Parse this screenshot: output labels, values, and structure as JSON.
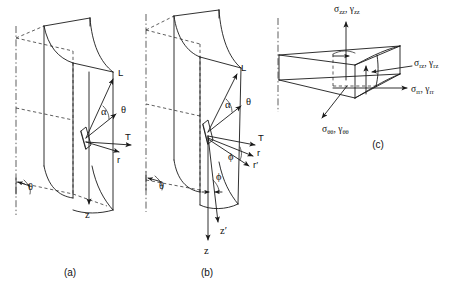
{
  "figure": {
    "background_color": "#ffffff",
    "line_color": "#1a1a1a",
    "width": 467,
    "height": 291
  },
  "panels": [
    {
      "id": "a",
      "caption": "(a)",
      "description": "cylindrical-sector-with-surface-element-single-axis",
      "labels": {
        "vector_L": "L",
        "angle_alpha": "α",
        "vector_theta": "θ",
        "vector_T": "T",
        "vector_r": "r",
        "angle_theta": "θ",
        "axis_z": "z"
      }
    },
    {
      "id": "b",
      "caption": "(b)",
      "description": "cylindrical-sector-with-surface-element-twisted-axes",
      "labels": {
        "vector_L": "L",
        "angle_alpha": "α",
        "vector_theta": "θ",
        "vector_T": "T",
        "vector_r": "r",
        "vector_r_prime": "r′",
        "angle_phi_vectors": "ϕ",
        "angle_theta": "θ",
        "angle_phi_base": "ϕ",
        "axis_z": "z",
        "axis_z_prime": "z′"
      }
    },
    {
      "id": "c",
      "caption": "(c)",
      "description": "wedge-stress-element",
      "stress_components": [
        {
          "name": "axial",
          "stress": "σ",
          "stress_sub": "zz",
          "strain": "γ",
          "strain_sub": "zz",
          "text": "σzz, γzz"
        },
        {
          "name": "shear-rz",
          "stress": "σ",
          "stress_sub": "rz",
          "strain": "γ",
          "strain_sub": "rz",
          "text": "σrz, γrz"
        },
        {
          "name": "radial",
          "stress": "σ",
          "stress_sub": "rr",
          "strain": "γ",
          "strain_sub": "rr",
          "text": "σrr, γrr"
        },
        {
          "name": "hoop",
          "stress": "σ",
          "stress_sub": "θθ",
          "strain": "γ",
          "strain_sub": "θθ",
          "text": "σθθ, γθθ"
        }
      ]
    }
  ]
}
